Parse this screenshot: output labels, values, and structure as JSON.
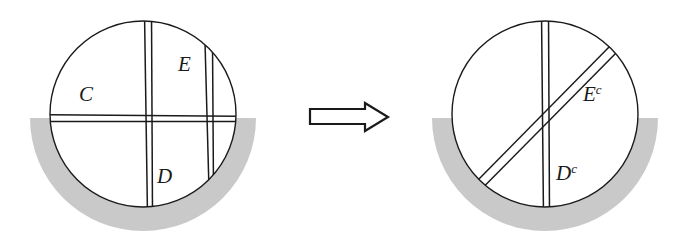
{
  "figure": {
    "title": "",
    "background_color": "#ffffff",
    "line_color": "#1a1a1a",
    "shade_color": "#c9c9c9",
    "disc_fill": "#ffffff"
  },
  "left_panel": {
    "name": "original-configuration",
    "disc": {
      "cx": 143,
      "cy": 114,
      "r": 93
    },
    "shaded_region": {
      "name": "lower-shaded-crescent",
      "description": "gray crescent below the chord, extending outside the disc",
      "outer_r": 113,
      "chord_y": 118
    },
    "bands": [
      {
        "name": "band-C",
        "orientation": "horizontal",
        "label": "C"
      },
      {
        "name": "band-D",
        "orientation": "vertical-left",
        "label": "D"
      },
      {
        "name": "band-E",
        "orientation": "vertical-right",
        "label": "E"
      }
    ],
    "labels": [
      {
        "name": "label-C",
        "text": "C",
        "sup": "",
        "x": 79,
        "y": 101
      },
      {
        "name": "label-E",
        "text": "E",
        "sup": "",
        "x": 178,
        "y": 71
      },
      {
        "name": "label-D",
        "text": "D",
        "sup": "",
        "x": 157,
        "y": 183
      }
    ]
  },
  "arrow": {
    "name": "implication-arrow",
    "direction": "right",
    "style": "hollow-outline-block-arrow",
    "x": 310,
    "y": 103,
    "width": 78,
    "height": 28
  },
  "right_panel": {
    "name": "complement-configuration",
    "disc": {
      "cx": 545,
      "cy": 114,
      "r": 93
    },
    "shaded_region": {
      "name": "lower-shaded-crescent",
      "description": "gray crescent below the chord, extending outside the disc",
      "outer_r": 113,
      "chord_y": 118
    },
    "bands": [
      {
        "name": "band-D-complement",
        "orientation": "vertical",
        "label": "D^c"
      },
      {
        "name": "band-E-complement",
        "orientation": "diagonal",
        "label": "E^c"
      }
    ],
    "labels": [
      {
        "name": "label-E-complement",
        "text": "E",
        "sup": "c",
        "x": 583,
        "y": 101
      },
      {
        "name": "label-D-complement",
        "text": "D",
        "sup": "c",
        "x": 556,
        "y": 180
      }
    ]
  }
}
